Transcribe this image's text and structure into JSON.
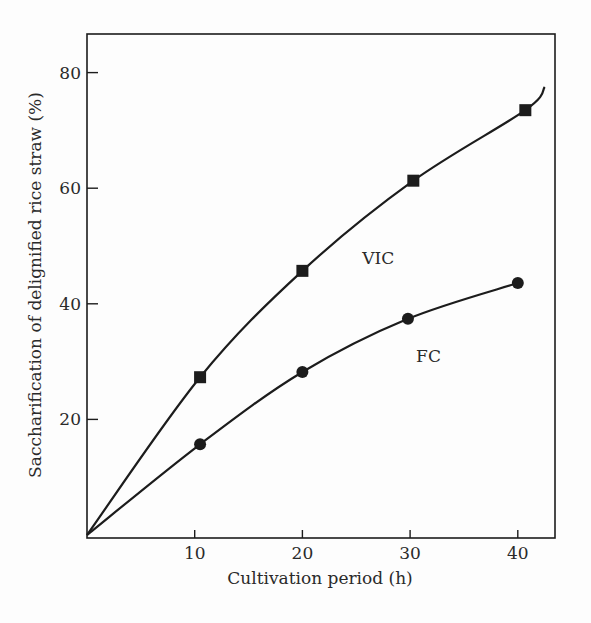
{
  "chart_data": {
    "type": "line",
    "title": "",
    "xlabel": "Cultivation period (h)",
    "ylabel": "Saccharification of delignified rice straw (%)",
    "xlim": [
      0,
      43
    ],
    "ylim": [
      0,
      87
    ],
    "x_ticks": [
      10,
      20,
      30,
      40
    ],
    "y_ticks": [
      20,
      40,
      60,
      80
    ],
    "grid": false,
    "legend": "inline labels",
    "series": [
      {
        "name": "VIC",
        "marker": "square",
        "x": [
          0,
          10.5,
          20,
          30.3,
          40.7
        ],
        "values": [
          0,
          27.3,
          45.7,
          61.3,
          73.5
        ],
        "curve_end": [
          42.5,
          77.5
        ]
      },
      {
        "name": "FC",
        "marker": "circle",
        "x": [
          0,
          10.5,
          20,
          29.8,
          40
        ],
        "values": [
          0,
          15.7,
          28.2,
          37.4,
          43.6
        ]
      }
    ],
    "annotations": [
      {
        "text": "VIC",
        "x": 25,
        "y": 48
      },
      {
        "text": "FC",
        "x": 30,
        "y": 31
      }
    ]
  },
  "colors": {
    "ink": "#1c1c1c",
    "background": "#fdfdfd"
  }
}
